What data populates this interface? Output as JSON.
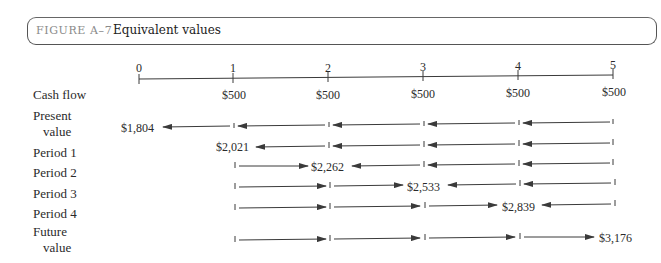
{
  "figure": {
    "label": "FIGURE A–7",
    "title": "Equivalent values"
  },
  "timeline": {
    "periods": [
      "0",
      "1",
      "2",
      "3",
      "4",
      "5"
    ]
  },
  "rows": {
    "cash_flow": {
      "label": "Cash flow",
      "values": [
        "$500",
        "$500",
        "$500",
        "$500",
        "$500"
      ]
    },
    "present_value": {
      "label_line1": "Present",
      "label_line2": "value",
      "amount": "$1,804"
    },
    "period_1": {
      "label": "Period 1",
      "amount": "$2,021"
    },
    "period_2": {
      "label": "Period 2",
      "amount": "$2,262"
    },
    "period_3": {
      "label": "Period 3",
      "amount": "$2,533"
    },
    "period_4": {
      "label": "Period 4",
      "amount": "$2,839"
    },
    "future_value": {
      "label_line1": "Future",
      "label_line2": "value",
      "amount": "$3,176"
    }
  },
  "colors": {
    "line": "#3a3a3a",
    "border": "#555555",
    "figure_label": "#8a8a8a"
  }
}
